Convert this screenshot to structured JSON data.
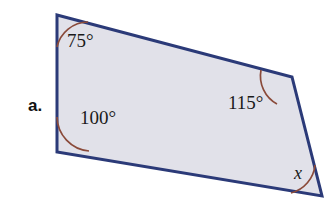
{
  "figure": {
    "item_label": "a.",
    "shape_name": "quadrilateral",
    "fill_color": "#e1e1e9",
    "stroke_color": "#2b3a78",
    "arc_color": "#8a4a3a",
    "background_color": "#ffffff",
    "vertices": [
      {
        "name": "top-left",
        "x": 57,
        "y": 15
      },
      {
        "name": "top-right",
        "x": 292,
        "y": 77
      },
      {
        "name": "bottom-right",
        "x": 322,
        "y": 196
      },
      {
        "name": "bottom-left",
        "x": 57,
        "y": 152
      }
    ],
    "angles": [
      {
        "vertex": "top-left",
        "label": "75°",
        "label_x": 67,
        "label_y": 30,
        "is_variable": false
      },
      {
        "vertex": "top-right",
        "label": "115°",
        "label_x": 228,
        "label_y": 92,
        "is_variable": false
      },
      {
        "vertex": "bottom-right",
        "label": "x",
        "label_x": 294,
        "label_y": 163,
        "is_variable": true
      },
      {
        "vertex": "bottom-left",
        "label": "100°",
        "label_x": 80,
        "label_y": 107,
        "is_variable": false
      }
    ]
  }
}
